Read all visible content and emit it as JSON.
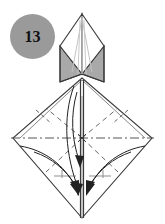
{
  "figure": {
    "kind": "origami-fold-diagram",
    "step_number": "13",
    "badge": {
      "label": "13",
      "fill_color": "#9a9a9a",
      "text_color": "#111111",
      "shape": "circle",
      "cx": 32.5,
      "cy": 36.5,
      "r": 22.5
    },
    "colors": {
      "paper_white": "#ffffff",
      "paper_shaded": "#a9a9a9",
      "paper_shaded_light": "#c3c3c3",
      "outline": "#3a3a3a",
      "fold_dashed": "#555555",
      "axis_dashdot": "#444444",
      "arrow": "#222222",
      "guide_gray": "#8f8f8f",
      "background": "#ffffff"
    },
    "canvas": {
      "width": 165,
      "height": 224
    },
    "geometry": {
      "center_x": 82,
      "top_apex": {
        "x": 82,
        "y": 14
      },
      "top_box_left": 60,
      "top_box_right": 104,
      "top_box_mid_y": 46,
      "top_box_bottom_y": 82,
      "diamond_left_tip": {
        "x": 13,
        "y": 138
      },
      "diamond_right_tip": {
        "x": 152,
        "y": 138
      },
      "diamond_top_vertex": {
        "x": 82,
        "y": 78
      },
      "diamond_bottom_vertex": {
        "x": 82,
        "y": 218
      },
      "center_point": {
        "x": 82,
        "y": 138
      }
    },
    "elements": [
      {
        "name": "top-point-flap",
        "type": "outline",
        "note": "pointed apex with converging crease lines"
      },
      {
        "name": "left-shaded-triangle",
        "type": "filled",
        "fill": "#a9a9a9"
      },
      {
        "name": "right-shaded-triangle",
        "type": "filled",
        "fill": "#a9a9a9"
      },
      {
        "name": "main-diamond",
        "type": "outline"
      },
      {
        "name": "horizontal-axis-line",
        "type": "dash-dot"
      },
      {
        "name": "vertical-center-line",
        "type": "solid"
      },
      {
        "name": "fold-line-dashed",
        "type": "dashed",
        "count": 4
      },
      {
        "name": "curved-arrow-left",
        "type": "arrow",
        "direction": "down-to-center"
      },
      {
        "name": "curved-arrow-right",
        "type": "arrow",
        "direction": "down-to-center"
      },
      {
        "name": "curved-arrow-inner-left",
        "type": "arrow",
        "direction": "down"
      },
      {
        "name": "curved-arrow-inner-right",
        "type": "arrow",
        "direction": "down"
      }
    ]
  }
}
